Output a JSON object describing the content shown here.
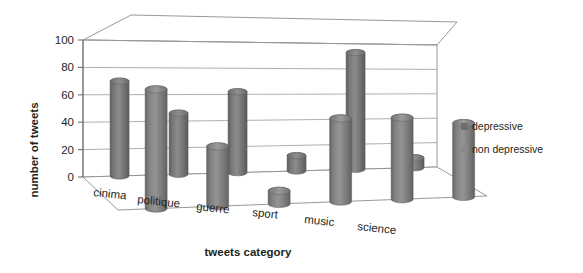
{
  "chart_data": {
    "type": "bar",
    "title": "",
    "xlabel": "tweets category",
    "ylabel": "number of tweets",
    "categories": [
      "cinima",
      "politique",
      "guerre",
      "sport",
      "music",
      "science"
    ],
    "series": [
      {
        "name": "depressive",
        "values": [
          70,
          46,
          62,
          12,
          93,
          8
        ],
        "color": "#6e6e6e"
      },
      {
        "name": "non depressive",
        "values": [
          88,
          45,
          10,
          65,
          65,
          60
        ],
        "color": "#7d7d7d"
      }
    ],
    "ylim": [
      0,
      100
    ],
    "yticks": [
      0,
      20,
      40,
      60,
      80,
      100
    ],
    "grid": true,
    "legend_position": "right",
    "projection": "3d-cylinder"
  },
  "axis": {
    "y_title": "number of tweets",
    "x_title": "tweets category",
    "y_tick_labels": [
      "100",
      "80",
      "60",
      "40",
      "20",
      "0"
    ],
    "x_tick_labels": [
      "cinima",
      "politique",
      "guerre",
      "sport",
      "music",
      "science"
    ]
  },
  "legend": {
    "items": [
      {
        "label": "depressive",
        "swatch": "#6e6e6e"
      },
      {
        "label": "non depressive",
        "swatch": "#8a8a8a"
      }
    ]
  }
}
